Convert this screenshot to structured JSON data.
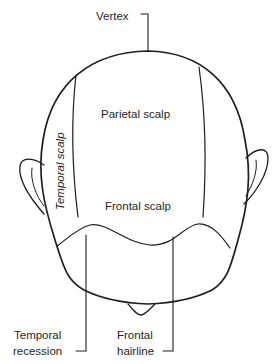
{
  "diagram": {
    "labels": {
      "vertex": "Vertex",
      "parietal": "Parietal scalp",
      "temporal": "Temporal scalp",
      "frontal": "Frontal scalp",
      "temporal_recession_line1": "Temporal",
      "temporal_recession_line2": "recession",
      "frontal_hairline_line1": "Frontal",
      "frontal_hairline_line2": "hairline"
    },
    "colors": {
      "stroke": "#1e1e1e",
      "background": "#ffffff"
    }
  }
}
